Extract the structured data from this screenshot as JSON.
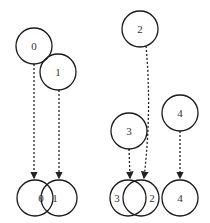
{
  "diagram": {
    "type": "node-merge-diagram",
    "colors": {
      "stroke": "#1a1a1a",
      "text": "#333333",
      "background": "#ffffff"
    },
    "nodes_top": [
      {
        "id": "n0-top",
        "label": "0",
        "cx": 34,
        "cy": 46,
        "r": 18
      },
      {
        "id": "n1-top",
        "label": "1",
        "cx": 58,
        "cy": 72,
        "r": 18
      },
      {
        "id": "n2-top",
        "label": "2",
        "cx": 140,
        "cy": 29,
        "r": 18
      },
      {
        "id": "n3-top",
        "label": "3",
        "cx": 129,
        "cy": 131,
        "r": 18
      },
      {
        "id": "n4-top",
        "label": "4",
        "cx": 180,
        "cy": 113,
        "r": 18
      }
    ],
    "nodes_bottom": [
      {
        "id": "n0-bottom",
        "label": "0",
        "cx": 35,
        "cy": 198,
        "r": 18,
        "lx": 41
      },
      {
        "id": "n1-bottom",
        "label": "1",
        "cx": 59,
        "cy": 198,
        "r": 18,
        "lx": 55
      },
      {
        "id": "n3-bottom",
        "label": "3",
        "cx": 128,
        "cy": 198,
        "r": 18,
        "lx": 117
      },
      {
        "id": "n2-bottom",
        "label": "2",
        "cx": 141,
        "cy": 198,
        "r": 18,
        "lx": 152
      },
      {
        "id": "n4-bottom",
        "label": "4",
        "cx": 180,
        "cy": 198,
        "r": 18,
        "lx": 180
      }
    ],
    "edges": [
      {
        "from": "0",
        "to": "0",
        "path": "M34 64 L34 178"
      },
      {
        "from": "1",
        "to": "1",
        "path": "M59 90 L59 178"
      },
      {
        "from": "2",
        "to": "2",
        "path": "M146 46 Q152 110 144 178"
      },
      {
        "from": "3",
        "to": "3",
        "path": "M129 149 L130 178"
      },
      {
        "from": "4",
        "to": "4",
        "path": "M180 131 L180 178"
      }
    ]
  }
}
